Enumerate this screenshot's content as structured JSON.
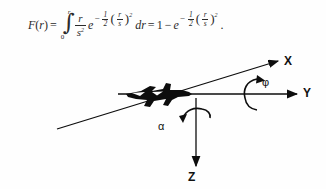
{
  "figure": {
    "background_color": "#fefefe",
    "ink_color": "#1a1a1a"
  },
  "formula": {
    "function_name": "F",
    "function_arg": "r",
    "equals": "=",
    "integral_symbol": "∫",
    "integral_lower_limit": "0",
    "integral_upper_limit": "r",
    "integrand_numerator": "r",
    "integrand_denominator": "s",
    "integrand_denominator_power": "2",
    "exponential_base": "e",
    "exponent_sign": "−",
    "exponent_coefficient_num": "1",
    "exponent_coefficient_den": "2",
    "exponent_inner_num": "r",
    "exponent_inner_den": "s",
    "exponent_outer_power": "2",
    "differential": "dr",
    "equals_two": "=",
    "rhs_one": "1",
    "rhs_minus": "−",
    "paren_open": "(",
    "paren_close": ")",
    "trailing_punctuation": "."
  },
  "diagram": {
    "axes": [
      {
        "id": "x",
        "label": "X",
        "direction": "up-right diagonal",
        "arrow": true
      },
      {
        "id": "y",
        "label": "Y",
        "direction": "right horizontal",
        "arrow": true
      },
      {
        "id": "z",
        "label": "Z",
        "direction": "down vertical",
        "arrow": true
      }
    ],
    "rotations": [
      {
        "id": "phi",
        "label": "φ",
        "about_axis": "Y"
      },
      {
        "id": "alpha",
        "label": "α",
        "about_axis": "Z"
      }
    ],
    "aircraft": {
      "name": "aircraft-silhouette",
      "color": "#0d0d0d"
    }
  }
}
